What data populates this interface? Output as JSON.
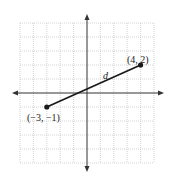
{
  "chart_data": {
    "type": "line",
    "title": "",
    "xlabel": "",
    "ylabel": "",
    "xlim": [
      -5,
      5
    ],
    "ylim": [
      -5,
      5
    ],
    "grid": true,
    "grid_style": "dotted",
    "axes_arrows": true,
    "series": [
      {
        "name": "segment d",
        "points": [
          {
            "x": -3,
            "y": -1,
            "label": "(−3, −1)"
          },
          {
            "x": 4,
            "y": 2,
            "label": "(4, 2)"
          }
        ],
        "label": "d",
        "markers": "filled-circle"
      }
    ]
  },
  "labels": {
    "point_a": "(−3, −1)",
    "point_b": "(4, 2)",
    "segment": "d"
  },
  "colors": {
    "grid": "#c8c8c8",
    "axis": "#333333",
    "segment": "#1a1a1a",
    "text": "#222222"
  },
  "geometry": {
    "origin_px": [
      87,
      93
    ],
    "unit_px_x": 13.4,
    "unit_px_y": 14.0
  }
}
